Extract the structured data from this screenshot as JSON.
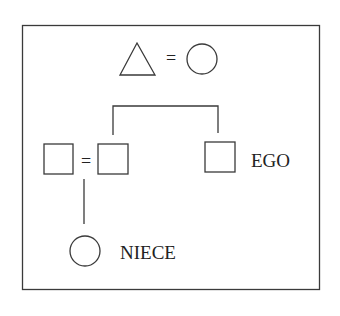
{
  "diagram": {
    "type": "kinship-chart",
    "legend": {
      "symbol_left": "triangle",
      "relation": "=",
      "symbol_right": "circle"
    },
    "nodes": [
      {
        "id": "parent-spouse",
        "shape": "square",
        "label": ""
      },
      {
        "id": "sibling",
        "shape": "square",
        "label": ""
      },
      {
        "id": "ego",
        "shape": "square",
        "label": "EGO"
      },
      {
        "id": "niece",
        "shape": "circle",
        "label": "NIECE"
      }
    ],
    "marriage_symbol": "=",
    "labels": {
      "ego": "EGO",
      "niece": "NIECE",
      "equals_top": "=",
      "equals_middle": "="
    }
  }
}
